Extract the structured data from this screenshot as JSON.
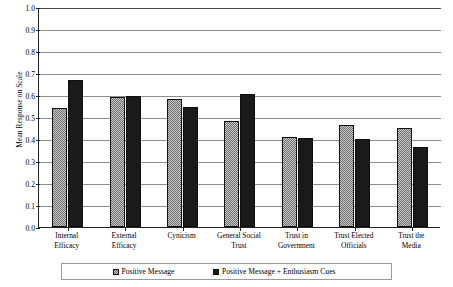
{
  "chart_data": {
    "type": "bar",
    "title": "",
    "xlabel": "",
    "ylabel": "Mean Response on Scale",
    "ylim": [
      0.0,
      1.0
    ],
    "ytick_labels": [
      "1.0",
      "0.9",
      "0.8",
      "0.7",
      "0.6",
      "0.5",
      "0.4",
      "0.3",
      "0.2",
      "0.1",
      "0.0"
    ],
    "ytick_values": [
      1.0,
      0.9,
      0.8,
      0.7,
      0.6,
      0.5,
      0.4,
      0.3,
      0.2,
      0.1,
      0.0
    ],
    "grid": true,
    "legend_position": "bottom",
    "categories": [
      "Internal Efficacy",
      "External Efficacy",
      "Cynicism",
      "General Social Trust",
      "Trust in Government",
      "Trust Elected Officials",
      "Trust the Media"
    ],
    "category_lines": [
      [
        "Internal",
        "Efficacy"
      ],
      [
        "External",
        "Efficacy"
      ],
      [
        "Cynicism"
      ],
      [
        "General Social",
        "Trust"
      ],
      [
        "Trust in",
        "Government"
      ],
      [
        "Trust Elected",
        "Officials"
      ],
      [
        "Trust the",
        "Media"
      ]
    ],
    "series": [
      {
        "name": "Positive Message",
        "color": "#8f8f8f",
        "pattern": "checkered",
        "values": [
          0.54,
          0.59,
          0.58,
          0.48,
          0.41,
          0.465,
          0.45
        ]
      },
      {
        "name": "Positive Message + Enthusiasm Cues",
        "color": "#1a1a1a",
        "pattern": "solid",
        "values": [
          0.67,
          0.595,
          0.545,
          0.605,
          0.405,
          0.4,
          0.365
        ]
      }
    ]
  },
  "legend": {
    "entries": [
      {
        "label": "Positive Message"
      },
      {
        "label": "Positive Message + Enthusiasm Cues"
      }
    ]
  }
}
